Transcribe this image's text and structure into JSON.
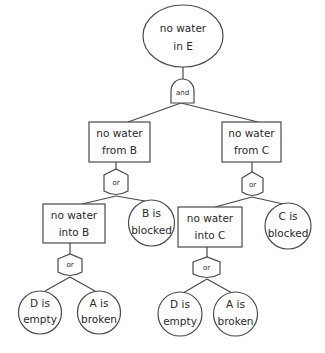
{
  "diagram": {
    "type": "fault-tree",
    "top_event": {
      "line1": "no water",
      "line2": "in E",
      "shape": "ellipse"
    },
    "gates": {
      "top": {
        "label": "and",
        "type": "and"
      },
      "from_b": {
        "label": "or",
        "type": "or"
      },
      "from_c": {
        "label": "or",
        "type": "or"
      },
      "into_b": {
        "label": "or",
        "type": "or"
      },
      "into_c": {
        "label": "or",
        "type": "or"
      }
    },
    "intermediate_events": {
      "from_b": {
        "line1": "no water",
        "line2": "from B"
      },
      "from_c": {
        "line1": "no water",
        "line2": "from C"
      },
      "into_b": {
        "line1": "no water",
        "line2": "into B"
      },
      "into_c": {
        "line1": "no water",
        "line2": "into C"
      }
    },
    "basic_events": {
      "b_blocked": {
        "line1": "B is",
        "line2": "blocked"
      },
      "c_blocked": {
        "line1": "C is",
        "line2": "blocked"
      },
      "d_empty_left": {
        "line1": "D is",
        "line2": "empty"
      },
      "a_broken_left": {
        "line1": "A is",
        "line2": "broken"
      },
      "d_empty_right": {
        "line1": "D is",
        "line2": "empty"
      },
      "a_broken_right": {
        "line1": "A is",
        "line2": "broken"
      }
    },
    "colors": {
      "stroke": "#4a4a4a",
      "fill": "#ffffff",
      "text": "#2a2a2a"
    }
  }
}
